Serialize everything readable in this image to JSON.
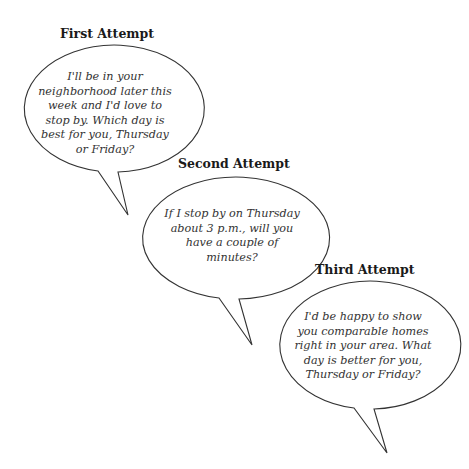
{
  "colors": {
    "background": "#ffffff",
    "outline": "#333333",
    "title_text": "#1a1a1a",
    "body_text": "#333333"
  },
  "attempts": [
    {
      "title": "First Attempt",
      "lines": [
        "I'll be in your",
        "neighborhood later this",
        "week and I'd love to",
        "stop by. Which day is",
        "best for you, Thursday",
        "or Friday?"
      ]
    },
    {
      "title": "Second Attempt",
      "lines": [
        "If I stop by on Thursday",
        "about 3 p.m., will you",
        "have a couple of",
        "minutes?"
      ]
    },
    {
      "title": "Third Attempt",
      "lines": [
        "I'd be happy to show",
        "you comparable homes",
        "right in your area. What",
        "day is better for you,",
        "Thursday or Friday?"
      ]
    }
  ]
}
